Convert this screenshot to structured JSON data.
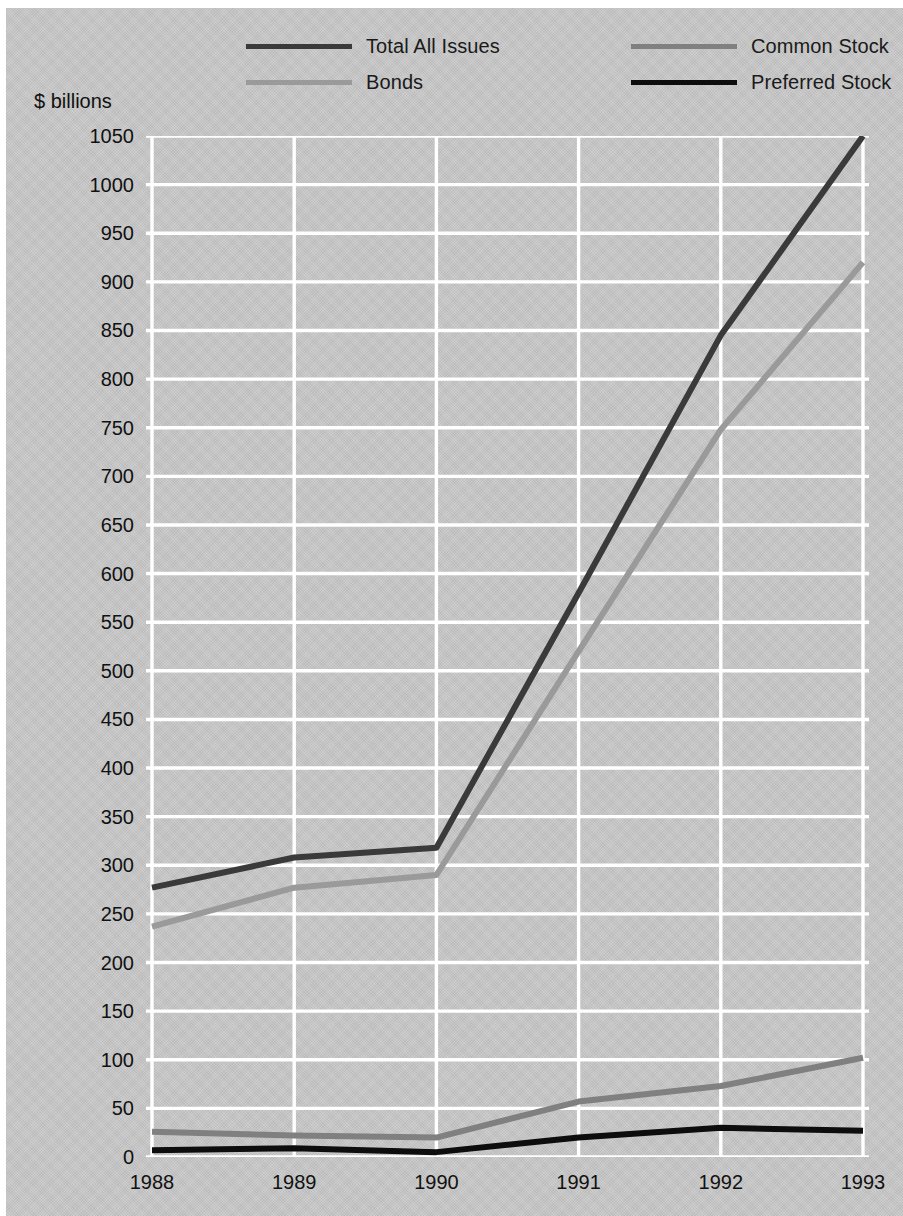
{
  "figure": {
    "background_color": "#c8c8c8",
    "unit_caption": "$ billions"
  },
  "legend": {
    "position": "top",
    "items": [
      {
        "label": "Total All Issues",
        "color": "#3a3a3a"
      },
      {
        "label": "Common Stock",
        "color": "#808080"
      },
      {
        "label": "Bonds",
        "color": "#9a9a9a"
      },
      {
        "label": "Preferred Stock",
        "color": "#0d0d0d"
      }
    ]
  },
  "chart_data": {
    "type": "line",
    "title": "",
    "subtitle": "",
    "xlabel": "",
    "ylabel": "$ billions",
    "categories": [
      "1988",
      "1989",
      "1990",
      "1991",
      "1992",
      "1993"
    ],
    "x": [
      1988,
      1989,
      1990,
      1991,
      1992,
      1993
    ],
    "xlim": [
      1988,
      1993
    ],
    "ylim": [
      0,
      1050
    ],
    "ytick_step": 50,
    "yticks": [
      0,
      50,
      100,
      150,
      200,
      250,
      300,
      350,
      400,
      450,
      500,
      550,
      600,
      650,
      700,
      750,
      800,
      850,
      900,
      950,
      1000,
      1050
    ],
    "ytick_labels": [
      "0",
      "50",
      "100",
      "150",
      "200",
      "250",
      "300",
      "350",
      "400",
      "450",
      "500",
      "550",
      "600",
      "650",
      "700",
      "750",
      "800",
      "850",
      "900",
      "950",
      "1000",
      "1050"
    ],
    "xticks": [
      1988,
      1989,
      1990,
      1991,
      1992,
      1993
    ],
    "xtick_labels": [
      "1988",
      "1989",
      "1990",
      "1991",
      "1992",
      "1993"
    ],
    "grid": true,
    "grid_color": "#ffffff",
    "legend_position": "top",
    "series": [
      {
        "name": "Total All Issues",
        "color": "#3a3a3a",
        "width": 6,
        "values": [
          277,
          308,
          318,
          580,
          845,
          1050
        ]
      },
      {
        "name": "Bonds",
        "color": "#9a9a9a",
        "width": 6,
        "values": [
          237,
          277,
          290,
          520,
          748,
          920
        ]
      },
      {
        "name": "Common Stock",
        "color": "#808080",
        "width": 6,
        "values": [
          26,
          22,
          20,
          57,
          73,
          102
        ]
      },
      {
        "name": "Preferred Stock",
        "color": "#0d0d0d",
        "width": 6,
        "values": [
          7,
          9,
          5,
          20,
          30,
          27
        ]
      }
    ]
  }
}
